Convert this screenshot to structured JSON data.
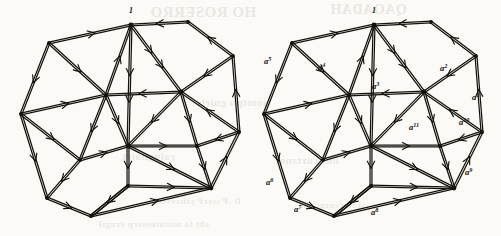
{
  "figure": {
    "type": "directed-graph-diagram",
    "panels": [
      {
        "id": "left",
        "name": "unlabeled-copy",
        "vertex_labels": [
          {
            "text": "1",
            "x": 131,
            "y": 13
          }
        ],
        "edge_labels": []
      },
      {
        "id": "right",
        "name": "labeled-copy",
        "vertex_labels": [
          {
            "text": "1",
            "x": 374,
            "y": 13
          }
        ],
        "edge_labels": [
          {
            "base": "a",
            "exponent": "1",
            "x": 472,
            "y": 100
          },
          {
            "base": "a",
            "exponent": "2",
            "x": 440,
            "y": 71
          },
          {
            "base": "a",
            "exponent": "3",
            "x": 372,
            "y": 89
          },
          {
            "base": "a",
            "exponent": "4",
            "x": 318,
            "y": 70
          },
          {
            "base": "a",
            "exponent": "5",
            "x": 264,
            "y": 64
          },
          {
            "base": "a",
            "exponent": "6",
            "x": 266,
            "y": 185
          },
          {
            "base": "a",
            "exponent": "7",
            "x": 294,
            "y": 212
          },
          {
            "base": "a",
            "exponent": "8",
            "x": 371,
            "y": 215
          },
          {
            "base": "a",
            "exponent": "9",
            "x": 465,
            "y": 175
          },
          {
            "base": "a",
            "exponent": "10",
            "x": 459,
            "y": 125
          },
          {
            "base": "a",
            "exponent": "11",
            "x": 409,
            "y": 130
          }
        ]
      }
    ],
    "colors": {
      "ink": "#15120e",
      "paper": "#fbfaf7",
      "bleed_through": "#3a2f22"
    },
    "bleed_through_text": [
      {
        "text": "HO ROSERRO",
        "x": 150,
        "y": 4,
        "size": 15
      },
      {
        "text": "QAOADAH",
        "x": 330,
        "y": 2,
        "size": 14
      },
      {
        "text": "aomtpu gnirb",
        "x": 198,
        "y": 96,
        "size": 11
      },
      {
        "text": "ralugnairt",
        "x": 122,
        "y": 150,
        "size": 11
      },
      {
        "text": "noitcurtsnoc",
        "x": 274,
        "y": 154,
        "size": 11
      },
      {
        "text": "D .P  sserP ytisrevinU",
        "x": 150,
        "y": 196,
        "size": 9
      },
      {
        "text": "srotarenegi  eht",
        "x": 300,
        "y": 200,
        "size": 9
      },
      {
        "text": "eht fo noitatneserp  erugiF",
        "x": 96,
        "y": 219,
        "size": 9
      }
    ]
  }
}
